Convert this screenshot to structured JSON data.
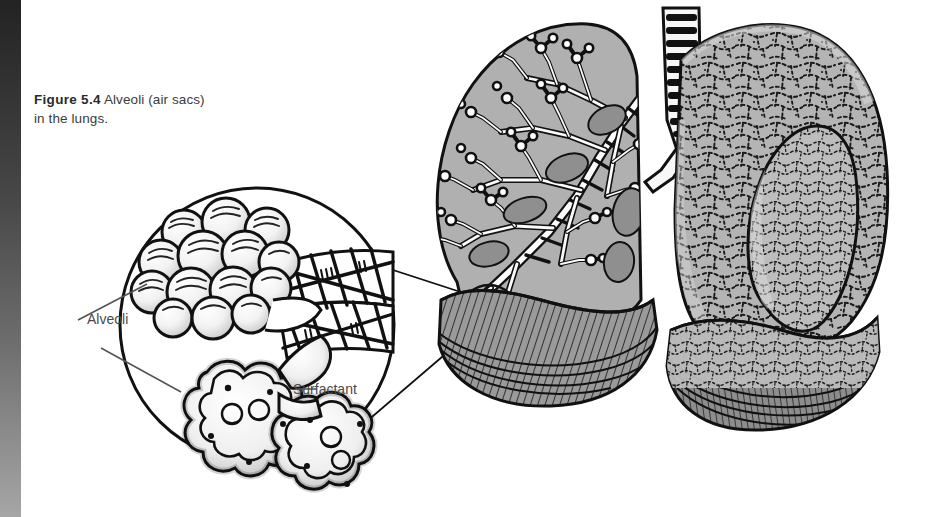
{
  "figure": {
    "label": "Figure 5.4",
    "caption": "Alveoli (air sacs) in the lungs.",
    "caption_line1": "Alveoli (air sacs)",
    "caption_line2": "in the lungs."
  },
  "annotations": {
    "alveoli": "Alveoli",
    "surfactant": "Surfactant"
  },
  "illustration": {
    "title": "Alveoli (air sacs) in the lungs",
    "type": "anatomical line drawing",
    "parts": [
      "trachea",
      "left lung with bronchial tree",
      "right lung with alveolar surface texture",
      "magnified circular inset",
      "alveolar sac cluster",
      "capillary network",
      "alveolar cross-section with surfactant lining"
    ]
  },
  "colors": {
    "ink": "#111111",
    "lung_fill": "#a8a8a8",
    "lung_fill_light": "#c2c2c2",
    "lung_shadow": "#7d7d7d",
    "text": "#4a4a4a",
    "caption_text": "#3b3b3b",
    "background": "#ffffff",
    "gutter_dark": "#232323",
    "gutter_light": "#a6a6a6"
  }
}
